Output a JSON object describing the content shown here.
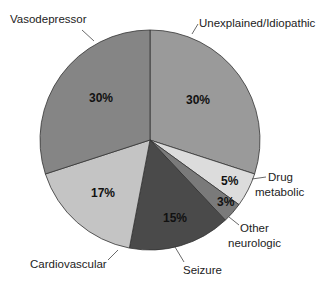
{
  "chart_data": {
    "type": "pie",
    "title": "",
    "start_angle_deg": 0,
    "direction": "clockwise",
    "slices": [
      {
        "label": "Unexplained/Idiopathic",
        "value": 30,
        "pct_label": "30%",
        "color": "#9a9a9a"
      },
      {
        "label": "Drug metabolic",
        "value": 5,
        "pct_label": "5%",
        "color": "#dcdcdc"
      },
      {
        "label": "Other neurologic",
        "value": 3,
        "pct_label": "3%",
        "color": "#7a7a7a"
      },
      {
        "label": "Seizure",
        "value": 15,
        "pct_label": "15%",
        "color": "#4a4a4a"
      },
      {
        "label": "Cardiovascular",
        "value": 17,
        "pct_label": "17%",
        "color": "#c4c4c4"
      },
      {
        "label": "Vasodepressor",
        "value": 30,
        "pct_label": "30%",
        "color": "#858585"
      }
    ],
    "legend": "none (callout labels)"
  },
  "labels": {
    "unexplained": "Unexplained/Idiopathic",
    "drug_line1": "Drug",
    "drug_line2": "metabolic",
    "other_line1": "Other",
    "other_line2": "neurologic",
    "seizure": "Seizure",
    "cardio": "Cardiovascular",
    "vaso": "Vasodepressor"
  },
  "pcts": {
    "unexplained": "30%",
    "drug": "5%",
    "other": "3%",
    "seizure": "15%",
    "cardio": "17%",
    "vaso": "30%"
  }
}
